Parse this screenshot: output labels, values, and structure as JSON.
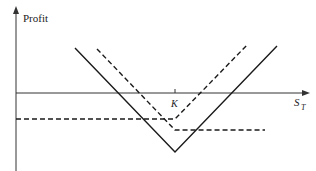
{
  "diagram": {
    "y_axis_label": "Profit",
    "x_axis_label_main": "S",
    "x_axis_label_sub": "T",
    "strike_label": "K",
    "colors": {
      "line": "#1a1a1a",
      "axis": "#333333"
    },
    "series": [
      {
        "name": "straddle-profit",
        "style": "solid",
        "points": [
          [
            75,
            48
          ],
          [
            175,
            152
          ],
          [
            277,
            46
          ]
        ]
      },
      {
        "name": "call-profit",
        "style": "dashed",
        "points": [
          [
            16,
            119
          ],
          [
            175,
            119
          ],
          [
            247,
            45
          ]
        ]
      },
      {
        "name": "put-profit",
        "style": "dashed",
        "points": [
          [
            97,
            49
          ],
          [
            175,
            130
          ],
          [
            265,
            130
          ]
        ]
      }
    ]
  }
}
